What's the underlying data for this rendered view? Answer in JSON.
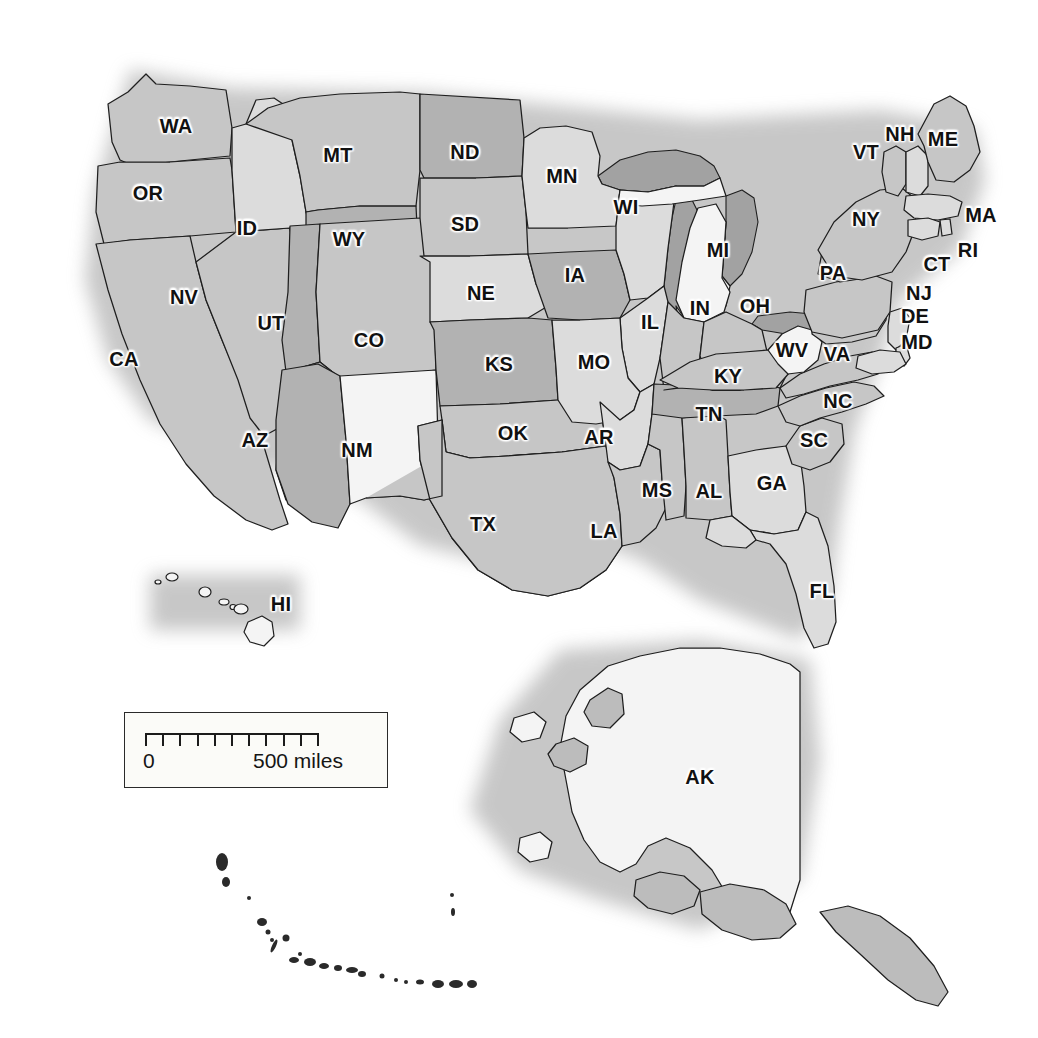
{
  "map": {
    "title": "United States political map with state abbreviations",
    "projection_note": "contiguous US with Alaska and Hawaii insets",
    "background_color": "#ffffff",
    "grid": {
      "visible": true,
      "line_color": "#8d8d95",
      "cell_size_px": 16.55,
      "origin_x": 18,
      "origin_y": 25
    },
    "shading": {
      "dark_fill": "#b2b2b2",
      "medium_fill": "#c6c6c6",
      "light_fill": "#dcdcdc",
      "white_fill": "#f4f4f4",
      "water_fill": "#a9a9a9",
      "border_color": "#1e1e1e"
    }
  },
  "scalebar": {
    "zero_label": "0",
    "max_label": "500 miles",
    "tick_count": 11,
    "units": "miles",
    "max_value": 500
  },
  "states": [
    {
      "code": "WA",
      "name": "Washington",
      "x": 176,
      "y": 126,
      "shade": "medium"
    },
    {
      "code": "OR",
      "name": "Oregon",
      "x": 148,
      "y": 193,
      "shade": "medium"
    },
    {
      "code": "ID",
      "name": "Idaho",
      "x": 247,
      "y": 228,
      "shade": "light"
    },
    {
      "code": "MT",
      "name": "Montana",
      "x": 338,
      "y": 155,
      "shade": "medium"
    },
    {
      "code": "WY",
      "name": "Wyoming",
      "x": 349,
      "y": 239,
      "shade": "dark"
    },
    {
      "code": "ND",
      "name": "North Dakota",
      "x": 465,
      "y": 152,
      "shade": "dark"
    },
    {
      "code": "SD",
      "name": "South Dakota",
      "x": 465,
      "y": 224,
      "shade": "medium"
    },
    {
      "code": "NE",
      "name": "Nebraska",
      "x": 481,
      "y": 293,
      "shade": "light"
    },
    {
      "code": "MN",
      "name": "Minnesota",
      "x": 562,
      "y": 176,
      "shade": "light"
    },
    {
      "code": "IA",
      "name": "Iowa",
      "x": 575,
      "y": 275,
      "shade": "dark"
    },
    {
      "code": "WI",
      "name": "Wisconsin",
      "x": 626,
      "y": 207,
      "shade": "light"
    },
    {
      "code": "MI",
      "name": "Michigan",
      "x": 718,
      "y": 250,
      "shade": "white"
    },
    {
      "code": "IL",
      "name": "Illinois",
      "x": 650,
      "y": 322,
      "shade": "light"
    },
    {
      "code": "IN",
      "name": "Indiana",
      "x": 700,
      "y": 308,
      "shade": "medium"
    },
    {
      "code": "OH",
      "name": "Ohio",
      "x": 755,
      "y": 306,
      "shade": "medium"
    },
    {
      "code": "MO",
      "name": "Missouri",
      "x": 594,
      "y": 362,
      "shade": "light"
    },
    {
      "code": "KS",
      "name": "Kansas",
      "x": 499,
      "y": 364,
      "shade": "dark"
    },
    {
      "code": "CO",
      "name": "Colorado",
      "x": 369,
      "y": 340,
      "shade": "medium"
    },
    {
      "code": "UT",
      "name": "Utah",
      "x": 271,
      "y": 323,
      "shade": "dark"
    },
    {
      "code": "NV",
      "name": "Nevada",
      "x": 184,
      "y": 297,
      "shade": "medium"
    },
    {
      "code": "CA",
      "name": "California",
      "x": 124,
      "y": 359,
      "shade": "medium"
    },
    {
      "code": "AZ",
      "name": "Arizona",
      "x": 255,
      "y": 440,
      "shade": "dark"
    },
    {
      "code": "NM",
      "name": "New Mexico",
      "x": 357,
      "y": 450,
      "shade": "white"
    },
    {
      "code": "OK",
      "name": "Oklahoma",
      "x": 513,
      "y": 433,
      "shade": "medium"
    },
    {
      "code": "TX",
      "name": "Texas",
      "x": 483,
      "y": 524,
      "shade": "medium"
    },
    {
      "code": "AR",
      "name": "Arkansas",
      "x": 599,
      "y": 437,
      "shade": "light"
    },
    {
      "code": "LA",
      "name": "Louisiana",
      "x": 604,
      "y": 531,
      "shade": "medium"
    },
    {
      "code": "MS",
      "name": "Mississippi",
      "x": 657,
      "y": 490,
      "shade": "medium"
    },
    {
      "code": "AL",
      "name": "Alabama",
      "x": 709,
      "y": 491,
      "shade": "medium"
    },
    {
      "code": "TN",
      "name": "Tennessee",
      "x": 709,
      "y": 414,
      "shade": "dark"
    },
    {
      "code": "KY",
      "name": "Kentucky",
      "x": 728,
      "y": 376,
      "shade": "medium"
    },
    {
      "code": "GA",
      "name": "Georgia",
      "x": 772,
      "y": 483,
      "shade": "light"
    },
    {
      "code": "FL",
      "name": "Florida",
      "x": 822,
      "y": 591,
      "shade": "light"
    },
    {
      "code": "SC",
      "name": "South Carolina",
      "x": 814,
      "y": 440,
      "shade": "medium"
    },
    {
      "code": "NC",
      "name": "North Carolina",
      "x": 838,
      "y": 401,
      "shade": "medium"
    },
    {
      "code": "VA",
      "name": "Virginia",
      "x": 837,
      "y": 354,
      "shade": "medium"
    },
    {
      "code": "WV",
      "name": "West Virginia",
      "x": 792,
      "y": 350,
      "shade": "white"
    },
    {
      "code": "PA",
      "name": "Pennsylvania",
      "x": 833,
      "y": 273,
      "shade": "medium"
    },
    {
      "code": "NY",
      "name": "New York",
      "x": 866,
      "y": 219,
      "shade": "medium"
    },
    {
      "code": "VT",
      "name": "Vermont",
      "x": 866,
      "y": 152,
      "shade": "medium"
    },
    {
      "code": "NH",
      "name": "New Hampshire",
      "x": 900,
      "y": 134,
      "shade": "light"
    },
    {
      "code": "ME",
      "name": "Maine",
      "x": 943,
      "y": 139,
      "shade": "medium"
    },
    {
      "code": "MA",
      "name": "Massachusetts",
      "x": 981,
      "y": 215,
      "shade": "light"
    },
    {
      "code": "RI",
      "name": "Rhode Island",
      "x": 968,
      "y": 250,
      "shade": "light"
    },
    {
      "code": "CT",
      "name": "Connecticut",
      "x": 937,
      "y": 264,
      "shade": "light"
    },
    {
      "code": "NJ",
      "name": "New Jersey",
      "x": 919,
      "y": 293,
      "shade": "light"
    },
    {
      "code": "DE",
      "name": "Delaware",
      "x": 915,
      "y": 316,
      "shade": "light"
    },
    {
      "code": "MD",
      "name": "Maryland",
      "x": 917,
      "y": 342,
      "shade": "light"
    },
    {
      "code": "AK",
      "name": "Alaska",
      "x": 700,
      "y": 777,
      "shade": "white"
    },
    {
      "code": "HI",
      "name": "Hawaii",
      "x": 281,
      "y": 604,
      "shade": "white"
    }
  ]
}
